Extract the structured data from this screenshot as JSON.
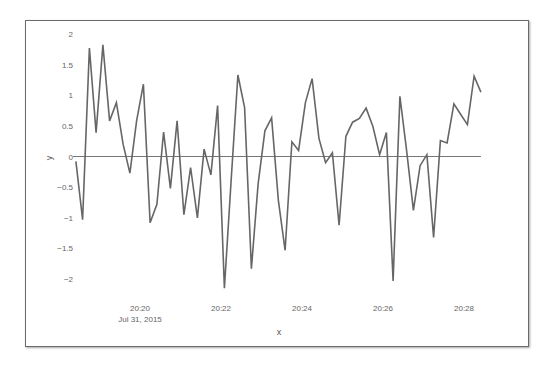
{
  "chart_data": {
    "type": "line",
    "title": "",
    "xlabel": "x",
    "ylabel": "y",
    "x_tick_labels": [
      "20:20",
      "20:22",
      "20:24",
      "20:26",
      "20:28"
    ],
    "x_tick_sublabel": "Jul 31, 2015",
    "x_tick_minutes": [
      20,
      22,
      24,
      26,
      28
    ],
    "x_range_minutes": [
      18.3,
      28.6
    ],
    "y_tick_labels": [
      "2",
      "1.5",
      "1",
      "0.5",
      "0",
      "-0.5",
      "-1",
      "-1.5",
      "-2"
    ],
    "y_ticks": [
      2,
      1.5,
      1,
      0.5,
      0,
      -0.5,
      -1,
      -1.5,
      -2
    ],
    "ylim": [
      -2.3,
      2.2
    ],
    "grid": false,
    "zero_line": true,
    "line_color": "#666666",
    "series": [
      {
        "name": "y",
        "start_time": "20:18:25",
        "interval_seconds": 10,
        "values": [
          -0.08,
          -1.03,
          1.77,
          0.39,
          1.82,
          0.58,
          0.88,
          0.2,
          -0.27,
          0.58,
          1.18,
          -1.08,
          -0.78,
          0.4,
          -0.52,
          0.58,
          -0.95,
          -0.18,
          -1.0,
          0.12,
          -0.3,
          0.83,
          -2.15,
          -0.4,
          1.33,
          0.8,
          -1.83,
          -0.45,
          0.42,
          0.63,
          -0.72,
          -1.53,
          0.24,
          0.1,
          0.88,
          1.27,
          0.3,
          -0.1,
          0.06,
          -1.12,
          0.33,
          0.56,
          0.62,
          0.79,
          0.49,
          0.03,
          0.39,
          -2.03,
          0.98,
          0.1,
          -0.88,
          -0.15,
          0.03,
          -1.32,
          0.26,
          0.22,
          0.86,
          0.69,
          0.52,
          1.31,
          1.05
        ]
      }
    ]
  }
}
